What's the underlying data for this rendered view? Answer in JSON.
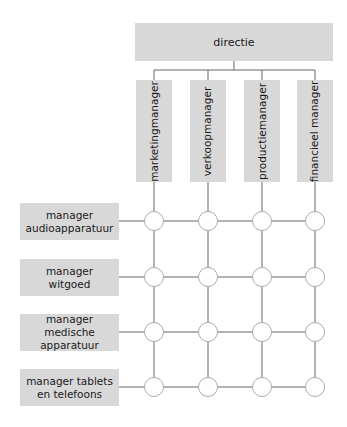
{
  "diagram": {
    "type": "matrix-organization",
    "top": {
      "label": "directie"
    },
    "columns": [
      {
        "label": "marketingmanager"
      },
      {
        "label": "verkoopmanager"
      },
      {
        "label": "productiemanager"
      },
      {
        "label": "financieel manager"
      }
    ],
    "rows": [
      {
        "label": "manager audioapparatuur"
      },
      {
        "label": "manager witgoed"
      },
      {
        "label": "manager medische apparatuur"
      },
      {
        "label": "manager tablets en telefoons"
      }
    ],
    "colors": {
      "box": "#d8d8d8",
      "line": "#555555",
      "node": "#ffffff"
    }
  }
}
